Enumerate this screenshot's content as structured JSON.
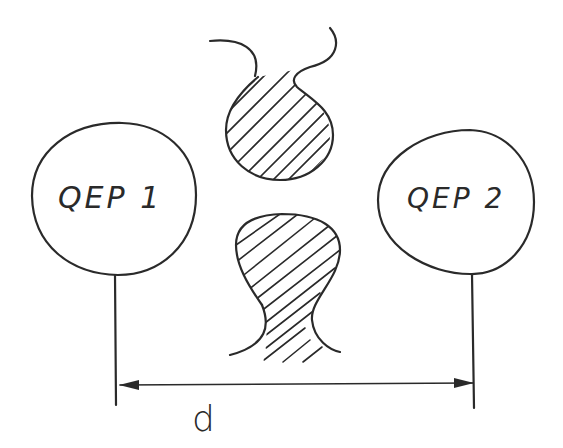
{
  "diagram": {
    "nodes": [
      {
        "id": "qep1",
        "label": "QEP 1"
      },
      {
        "id": "qep2",
        "label": "QEP 2"
      }
    ],
    "obstacles": [
      {
        "id": "upper-blob",
        "style": "hatched"
      },
      {
        "id": "lower-blob",
        "style": "hatched"
      }
    ],
    "dimension": {
      "label": "d",
      "from": "qep1",
      "to": "qep2",
      "arrows": "both"
    }
  },
  "colors": {
    "ink": "#2a2a2a",
    "background": "#ffffff"
  }
}
